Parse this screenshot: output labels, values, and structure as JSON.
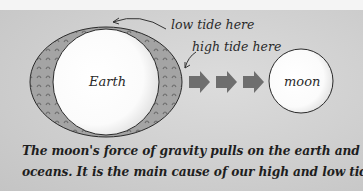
{
  "figure": {
    "labels": {
      "low_tide": "low tide here",
      "high_tide": "high tide here",
      "earth": "Earth",
      "moon": "moon"
    },
    "arrows": {
      "count": 3,
      "direction": "right",
      "meaning": "moon's gravitational pull"
    },
    "caption": {
      "line1": "The moon's force of gravity pulls on the earth and its",
      "line2": "oceans. It is the main cause of our high and low tides."
    },
    "colors": {
      "background": "#cfcfcf",
      "ocean_bulge": "#9a9a9a",
      "arrow": "#6e6e6e",
      "body_fill": "#ffffff",
      "text": "#222222"
    }
  }
}
